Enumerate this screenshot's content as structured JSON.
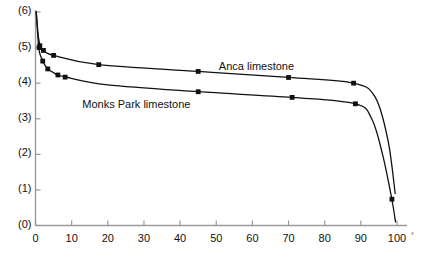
{
  "chart_data": {
    "type": "line",
    "title": "",
    "subtitle": "",
    "xlabel": "",
    "ylabel": "",
    "xlim": [
      0,
      100
    ],
    "ylim": [
      0,
      6
    ],
    "grid": false,
    "legend_position": "inline-annotation",
    "x_ticks": [
      0,
      10,
      20,
      30,
      40,
      50,
      60,
      70,
      80,
      90,
      100
    ],
    "x_tick_labels": [
      "0",
      "10",
      "20",
      "30",
      "40",
      "50",
      "60",
      "70",
      "80",
      "90",
      "100"
    ],
    "y_ticks": [
      0,
      1,
      2,
      3,
      4,
      5,
      6
    ],
    "y_tick_labels": [
      "(0)",
      "(1)",
      "(2)",
      "(3)",
      "(4)",
      "(5)",
      "(6)"
    ],
    "x_axis_suffix": "°",
    "series": [
      {
        "name": "Anca limestone",
        "label": "Anca limestone",
        "label_x": 64,
        "label_y": 4.42,
        "marker": "square",
        "color": "#111111",
        "points": [
          {
            "x": 0.2,
            "y": 6.0
          },
          {
            "x": 0.8,
            "y": 5.3
          },
          {
            "x": 1.4,
            "y": 5.02
          },
          {
            "x": 2.2,
            "y": 4.92
          },
          {
            "x": 5.0,
            "y": 4.78
          },
          {
            "x": 17.5,
            "y": 4.52
          },
          {
            "x": 45.0,
            "y": 4.33
          },
          {
            "x": 70.0,
            "y": 4.16
          },
          {
            "x": 88.0,
            "y": 4.0
          },
          {
            "x": 94.0,
            "y": 3.6
          },
          {
            "x": 97.5,
            "y": 2.4
          },
          {
            "x": 99.5,
            "y": 0.9
          }
        ]
      },
      {
        "name": "Monks Park limestone",
        "label": "Monks Park limestone",
        "label_x": 24,
        "label_y": 3.35,
        "marker": "square",
        "color": "#111111",
        "points": [
          {
            "x": 0.2,
            "y": 6.0
          },
          {
            "x": 0.9,
            "y": 5.0
          },
          {
            "x": 1.6,
            "y": 4.72
          },
          {
            "x": 3.0,
            "y": 4.45
          },
          {
            "x": 5.5,
            "y": 4.26
          },
          {
            "x": 8.0,
            "y": 4.18
          },
          {
            "x": 20.0,
            "y": 3.95
          },
          {
            "x": 45.0,
            "y": 3.76
          },
          {
            "x": 71.0,
            "y": 3.6
          },
          {
            "x": 88.5,
            "y": 3.42
          },
          {
            "x": 93.0,
            "y": 3.0
          },
          {
            "x": 96.0,
            "y": 2.0
          },
          {
            "x": 98.5,
            "y": 0.78
          },
          {
            "x": 99.6,
            "y": 0.1
          }
        ]
      }
    ],
    "marked_points": {
      "anca": [
        {
          "x": 1.2,
          "y": 5.05
        },
        {
          "x": 2.2,
          "y": 4.92
        },
        {
          "x": 5.0,
          "y": 4.78
        },
        {
          "x": 17.5,
          "y": 4.52
        },
        {
          "x": 45.0,
          "y": 4.33
        },
        {
          "x": 70.0,
          "y": 4.16
        },
        {
          "x": 88.0,
          "y": 4.0
        }
      ],
      "monks_park": [
        {
          "x": 1.0,
          "y": 5.0
        },
        {
          "x": 2.0,
          "y": 4.62
        },
        {
          "x": 3.4,
          "y": 4.4
        },
        {
          "x": 6.2,
          "y": 4.23
        },
        {
          "x": 8.2,
          "y": 4.17
        },
        {
          "x": 45.0,
          "y": 3.76
        },
        {
          "x": 71.0,
          "y": 3.6
        },
        {
          "x": 88.5,
          "y": 3.42
        },
        {
          "x": 98.6,
          "y": 0.74
        }
      ]
    },
    "axis_color": "#9a9a9a",
    "curve_color": "#111111",
    "background": "#ffffff"
  }
}
